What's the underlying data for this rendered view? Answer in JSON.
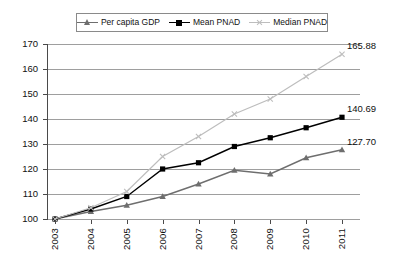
{
  "chart_data": {
    "type": "line",
    "title": "",
    "xlabel": "",
    "ylabel": "",
    "categories": [
      "2003",
      "2004",
      "2005",
      "2006",
      "2007",
      "2008",
      "2009",
      "2010",
      "2011"
    ],
    "ylim": [
      100,
      170
    ],
    "ytick_step": 10,
    "yticks": [
      170,
      160,
      150,
      140,
      130,
      120,
      110,
      100
    ],
    "grid": "horizontal",
    "legend_position": "top-center",
    "series": [
      {
        "name": "Per capita GDP",
        "marker": "triangle",
        "color": "#6e6e6e",
        "values": [
          100,
          103.0,
          105.5,
          109.0,
          114.0,
          119.5,
          118.0,
          124.5,
          127.7
        ],
        "end_label": "127.70"
      },
      {
        "name": "Mean PNAD",
        "marker": "square",
        "color": "#000000",
        "values": [
          100,
          104.0,
          109.0,
          120.0,
          122.5,
          129.0,
          132.5,
          136.5,
          140.69
        ],
        "end_label": "140.69"
      },
      {
        "name": "Median PNAD",
        "marker": "x",
        "color": "#bdbdbd",
        "values": [
          100,
          104.5,
          111.0,
          125.0,
          133.0,
          142.0,
          148.0,
          157.0,
          165.88
        ],
        "end_label": "165.88"
      }
    ]
  },
  "legend": {
    "items": [
      {
        "label": "Per capita GDP"
      },
      {
        "label": "Mean PNAD"
      },
      {
        "label": "Median PNAD"
      }
    ]
  },
  "axis": {
    "y_labels": [
      "170",
      "160",
      "150",
      "140",
      "130",
      "120",
      "110",
      "100"
    ],
    "x_labels": [
      "2003",
      "2004",
      "2005",
      "2006",
      "2007",
      "2008",
      "2009",
      "2010",
      "2011"
    ]
  },
  "data_labels": {
    "median_pnad": "165.88",
    "mean_pnad": "140.69",
    "per_capita_gdp": "127.70"
  }
}
